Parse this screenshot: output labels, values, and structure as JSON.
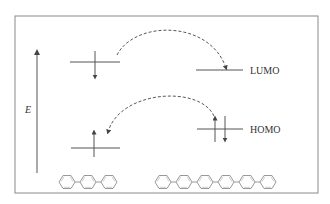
{
  "diagram": {
    "type": "energy-level-diagram",
    "axis": {
      "label": "E",
      "direction": "up"
    },
    "levels": {
      "lumo_label": "LUMO",
      "homo_label": "HOMO"
    },
    "molecules": {
      "left": {
        "rings": 3,
        "name": "terphenyl"
      },
      "right": {
        "rings": 6,
        "name": "sexiphenyl"
      }
    },
    "colors": {
      "frame": "#8a8a8a",
      "lines": "#555555",
      "rings": "#a0a0a0",
      "text": "#333333"
    }
  }
}
